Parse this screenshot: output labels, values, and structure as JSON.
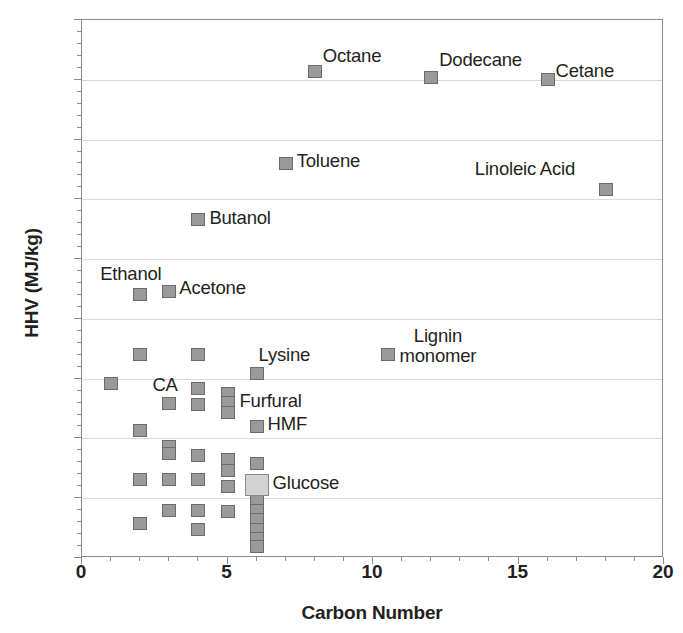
{
  "chart_data": {
    "type": "scatter",
    "title": "",
    "xlabel": "Carbon Number",
    "ylabel": "HHV (MJ/kg)",
    "xlim": [
      0,
      20
    ],
    "ylim": [
      10,
      55
    ],
    "xticks": [
      0,
      5,
      10,
      15,
      20
    ],
    "yticks": [
      10,
      15,
      20,
      25,
      30,
      35,
      40,
      45,
      50,
      55
    ],
    "grid": "horizontal",
    "legend": "none",
    "marker_shape": "square",
    "marker_color": "#9a9a9a",
    "marker_edge_color": "#6b6b6b",
    "highlight_color": "#d2d2d2",
    "series": [
      {
        "name": "Compounds",
        "points": [
          {
            "x": 1.0,
            "y": 24.6,
            "label": ""
          },
          {
            "x": 2.0,
            "y": 32.0,
            "label": "Ethanol"
          },
          {
            "x": 2.0,
            "y": 27.0,
            "label": ""
          },
          {
            "x": 2.0,
            "y": 20.7,
            "label": ""
          },
          {
            "x": 2.0,
            "y": 16.6,
            "label": ""
          },
          {
            "x": 2.0,
            "y": 12.9,
            "label": ""
          },
          {
            "x": 3.0,
            "y": 32.3,
            "label": "Acetone"
          },
          {
            "x": 3.0,
            "y": 22.9,
            "label": ""
          },
          {
            "x": 3.0,
            "y": 19.3,
            "label": ""
          },
          {
            "x": 3.0,
            "y": 18.7,
            "label": ""
          },
          {
            "x": 3.0,
            "y": 16.6,
            "label": ""
          },
          {
            "x": 3.0,
            "y": 14.0,
            "label": ""
          },
          {
            "x": 4.0,
            "y": 38.3,
            "label": "Butanol"
          },
          {
            "x": 4.0,
            "y": 27.0,
            "label": ""
          },
          {
            "x": 4.0,
            "y": 24.2,
            "label": "CA"
          },
          {
            "x": 4.0,
            "y": 22.8,
            "label": ""
          },
          {
            "x": 4.0,
            "y": 18.6,
            "label": ""
          },
          {
            "x": 4.0,
            "y": 16.6,
            "label": ""
          },
          {
            "x": 4.0,
            "y": 14.0,
            "label": ""
          },
          {
            "x": 4.0,
            "y": 12.4,
            "label": ""
          },
          {
            "x": 5.0,
            "y": 23.8,
            "label": "Furfural"
          },
          {
            "x": 5.0,
            "y": 23.0,
            "label": ""
          },
          {
            "x": 5.0,
            "y": 22.2,
            "label": ""
          },
          {
            "x": 5.0,
            "y": 18.2,
            "label": ""
          },
          {
            "x": 5.0,
            "y": 17.3,
            "label": ""
          },
          {
            "x": 5.0,
            "y": 16.0,
            "label": ""
          },
          {
            "x": 5.0,
            "y": 13.9,
            "label": ""
          },
          {
            "x": 6.0,
            "y": 25.4,
            "label": "Lysine"
          },
          {
            "x": 6.0,
            "y": 21.0,
            "label": "HMF"
          },
          {
            "x": 6.0,
            "y": 17.9,
            "label": ""
          },
          {
            "x": 6.0,
            "y": 16.1,
            "label": "Glucose"
          },
          {
            "x": 6.0,
            "y": 14.8,
            "label": ""
          },
          {
            "x": 6.0,
            "y": 14.0,
            "label": ""
          },
          {
            "x": 6.0,
            "y": 13.2,
            "label": ""
          },
          {
            "x": 6.0,
            "y": 12.4,
            "label": ""
          },
          {
            "x": 6.0,
            "y": 11.6,
            "label": ""
          },
          {
            "x": 6.0,
            "y": 11.0,
            "label": ""
          },
          {
            "x": 7.0,
            "y": 43.0,
            "label": "Toluene"
          },
          {
            "x": 8.0,
            "y": 50.7,
            "label": "Octane"
          },
          {
            "x": 10.5,
            "y": 27.0,
            "label": "Lignin monomer"
          },
          {
            "x": 12.0,
            "y": 50.2,
            "label": "Dodecane"
          },
          {
            "x": 16.0,
            "y": 50.0,
            "label": "Cetane"
          },
          {
            "x": 18.0,
            "y": 40.8,
            "label": "Linoleic Acid"
          }
        ]
      }
    ],
    "annotations": [
      {
        "text": "Octane",
        "x": 8.0,
        "y": 50.7
      },
      {
        "text": "Dodecane",
        "x": 12.0,
        "y": 50.2
      },
      {
        "text": "Cetane",
        "x": 16.0,
        "y": 50.0
      },
      {
        "text": "Toluene",
        "x": 7.0,
        "y": 43.0
      },
      {
        "text": "Linoleic Acid",
        "x": 18.0,
        "y": 40.8
      },
      {
        "text": "Butanol",
        "x": 4.0,
        "y": 38.3
      },
      {
        "text": "Ethanol",
        "x": 2.0,
        "y": 32.0
      },
      {
        "text": "Acetone",
        "x": 3.0,
        "y": 32.3
      },
      {
        "text": "Lignin monomer",
        "x": 10.5,
        "y": 27.0
      },
      {
        "text": "Lysine",
        "x": 6.0,
        "y": 25.4
      },
      {
        "text": "CA",
        "x": 4.0,
        "y": 24.2
      },
      {
        "text": "Furfural",
        "x": 5.0,
        "y": 23.8
      },
      {
        "text": "HMF",
        "x": 6.0,
        "y": 21.0
      },
      {
        "text": "Glucose",
        "x": 6.0,
        "y": 16.1
      }
    ]
  },
  "axes": {
    "y_title": "HHV (MJ/kg)",
    "x_title": "Carbon Number",
    "y_tick_labels": [
      "55",
      "50",
      "45",
      "40",
      "35",
      "30",
      "25",
      "20",
      "15",
      "10"
    ],
    "x_tick_labels": [
      "0",
      "5",
      "10",
      "15",
      "20"
    ]
  },
  "labels": {
    "octane": "Octane",
    "dodecane": "Dodecane",
    "cetane": "Cetane",
    "toluene": "Toluene",
    "linoleic_acid": "Linoleic Acid",
    "butanol": "Butanol",
    "ethanol": "Ethanol",
    "acetone": "Acetone",
    "lignin_line1": "Lignin",
    "lignin_line2": "monomer",
    "lysine": "Lysine",
    "ca": "CA",
    "furfural": "Furfural",
    "hmf": "HMF",
    "glucose": "Glucose"
  }
}
